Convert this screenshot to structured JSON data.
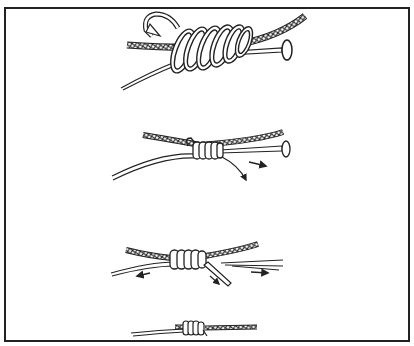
{
  "figure": {
    "type": "line-art illustration",
    "steps": [
      {
        "index": 1,
        "description": "line wrapped in coils around leader and nail, tag end passed back through",
        "coils": 6,
        "has_nail": true,
        "arrows": [
          "return-loop-arrow"
        ]
      },
      {
        "index": 2,
        "description": "coils snugged together, nail being withdrawn",
        "coils": 5,
        "has_nail": true,
        "arrows": [
          "tag-pull-arrow",
          "nail-withdraw-arrow"
        ]
      },
      {
        "index": 3,
        "description": "knot tightened by pulling ends apart",
        "coils": 5,
        "has_nail": false,
        "arrows": [
          "left-pull-arrow",
          "tag-pull-arrow",
          "right-pull-arrow"
        ]
      },
      {
        "index": 4,
        "description": "finished knot trimmed",
        "coils": 5,
        "has_nail": false,
        "arrows": []
      }
    ],
    "colors": {
      "ink": "#222222",
      "paper": "#ffffff",
      "frame": "#222222"
    }
  }
}
